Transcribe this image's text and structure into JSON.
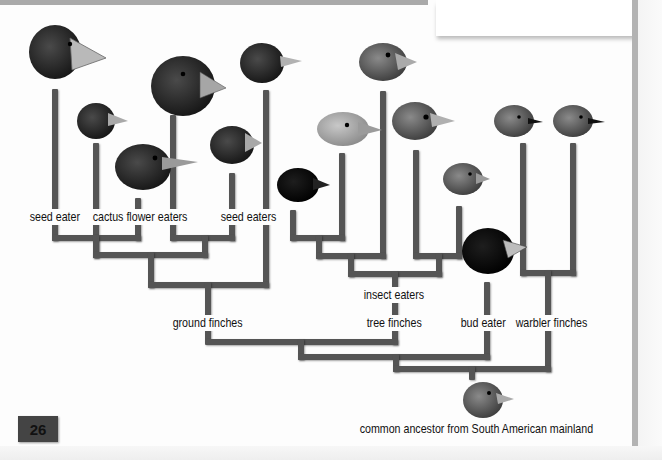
{
  "page": {
    "page_number": "26",
    "colors": {
      "branch": "#555555",
      "background": "#fdfdfd",
      "badge": "#444444",
      "frame": "#b3b3b3"
    }
  },
  "diagram": {
    "type": "phylogenetic-tree",
    "leaf_labels": {
      "seed_eater": "seed eater",
      "cactus_flower_eaters": "cactus flower eaters",
      "seed_eaters": "seed eaters"
    },
    "group_labels": {
      "insect_eaters": "insect eaters",
      "ground_finches": "ground finches",
      "tree_finches": "tree finches",
      "bud_eater": "bud eater",
      "warbler_finches": "warbler finches"
    },
    "root_label": "common ancestor from South American mainland",
    "birds": [
      {
        "name": "large-ground-finch",
        "group": "ground finches"
      },
      {
        "name": "small-ground-finch",
        "group": "ground finches"
      },
      {
        "name": "cactus-finch",
        "group": "ground finches"
      },
      {
        "name": "large-cactus-finch",
        "group": "ground finches"
      },
      {
        "name": "sharp-beaked-finch",
        "group": "ground finches"
      },
      {
        "name": "medium-ground-finch",
        "group": "ground finches"
      },
      {
        "name": "woodpecker-finch",
        "group": "tree finches"
      },
      {
        "name": "small-insectivorous-tree-finch",
        "group": "tree finches"
      },
      {
        "name": "large-insectivorous-tree-finch",
        "group": "tree finches"
      },
      {
        "name": "mangrove-finch",
        "group": "tree finches"
      },
      {
        "name": "small-tree-finch",
        "group": "tree finches"
      },
      {
        "name": "vegetarian-finch",
        "group": "bud eater"
      },
      {
        "name": "grey-warbler-finch",
        "group": "warbler finches"
      },
      {
        "name": "green-warbler-finch",
        "group": "warbler finches"
      },
      {
        "name": "ancestor-finch",
        "group": "common ancestor"
      }
    ]
  }
}
